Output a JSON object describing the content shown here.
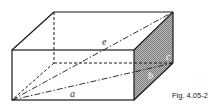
{
  "figure": {
    "caption": "Fig. 4.05-2",
    "labels": {
      "length": "a",
      "depth": "b",
      "height": "c",
      "space_diagonal": "e"
    },
    "colors": {
      "line": "#1a1a1a",
      "shaded_face": "#9a9a9a",
      "background": "#ffffff"
    }
  }
}
